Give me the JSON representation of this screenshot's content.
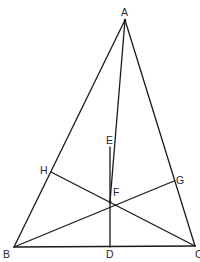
{
  "diagram": {
    "type": "geometry",
    "stroke_color": "#1a1a1a",
    "label_color": "#2a2a2a",
    "points": {
      "A": {
        "label": "A",
        "x": 125,
        "y": 20
      },
      "B": {
        "label": "B",
        "x": 14,
        "y": 247
      },
      "C": {
        "label": "C",
        "x": 195,
        "y": 246
      },
      "D": {
        "label": "D",
        "x": 110,
        "y": 247
      },
      "E": {
        "label": "E",
        "x": 110,
        "y": 147
      },
      "F": {
        "label": "F",
        "x": 110,
        "y": 202
      },
      "G": {
        "label": "G",
        "x": 174,
        "y": 181
      },
      "H": {
        "label": "H",
        "x": 51,
        "y": 172
      }
    },
    "segments": [
      [
        "A",
        "B"
      ],
      [
        "A",
        "C"
      ],
      [
        "B",
        "C"
      ],
      [
        "A",
        "F"
      ],
      [
        "E",
        "D"
      ],
      [
        "B",
        "G"
      ],
      [
        "C",
        "H"
      ]
    ]
  }
}
